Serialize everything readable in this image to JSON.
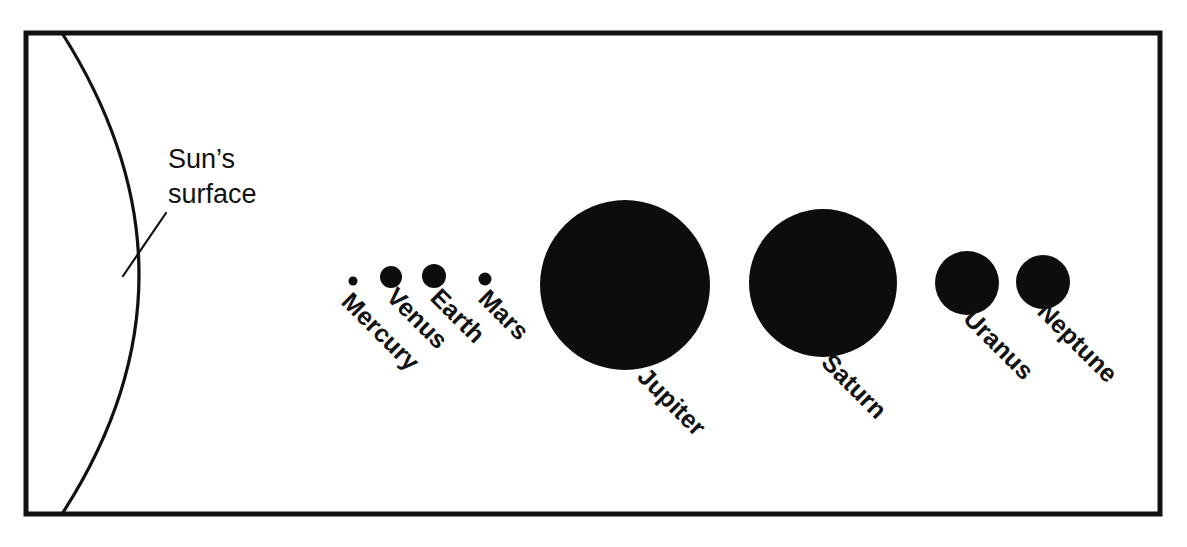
{
  "figure": {
    "background_color": "#ffffff",
    "ink_color": "#111111",
    "planet_fill_color": "#0d0d0d"
  },
  "frame": {
    "x": 26,
    "y": 33,
    "width": 1134,
    "height": 481
  },
  "sun": {
    "label_line_1": "Sun’s",
    "label_line_2": "surface",
    "label_x": 168,
    "label_line_1_y": 168,
    "label_line_2_y": 203,
    "leader_from_x": 166,
    "leader_from_y": 213,
    "leader_to_x": 123,
    "leader_to_y": 276,
    "arc_top_x": 62,
    "arc_top_y": 33,
    "arc_bottom_x": 62,
    "arc_bottom_y": 514,
    "arc_bulge_x": 139,
    "arc_bulge_y": 276
  },
  "chart_data": {
    "type": "scatter",
    "xlabel": "",
    "ylabel": "",
    "categories": [
      "Mercury",
      "Venus",
      "Earth",
      "Mars",
      "Jupiter",
      "Saturn",
      "Uranus",
      "Neptune"
    ],
    "values": [
      9,
      22,
      24,
      13,
      170,
      148,
      64,
      54
    ],
    "value_units": "pixel diameter (relative planet size)",
    "annotations": [
      "Sun’s surface"
    ],
    "grid": false,
    "legend": false
  },
  "planets": [
    {
      "name": "Mercury",
      "cx": 353,
      "cy": 281,
      "diameter": 9,
      "label_x": 340,
      "label_y": 303,
      "label_rotation": 45
    },
    {
      "name": "Venus",
      "cx": 391,
      "cy": 277,
      "diameter": 22,
      "label_x": 385,
      "label_y": 298,
      "label_rotation": 45
    },
    {
      "name": "Earth",
      "cx": 434,
      "cy": 276,
      "diameter": 24,
      "label_x": 429,
      "label_y": 299,
      "label_rotation": 45
    },
    {
      "name": "Mars",
      "cx": 485,
      "cy": 279,
      "diameter": 13,
      "label_x": 477,
      "label_y": 300,
      "label_rotation": 45
    },
    {
      "name": "Jupiter",
      "cx": 625,
      "cy": 285,
      "diameter": 170,
      "label_x": 636,
      "label_y": 378,
      "label_rotation": 45
    },
    {
      "name": "Saturn",
      "cx": 823,
      "cy": 283,
      "diameter": 148,
      "label_x": 820,
      "label_y": 364,
      "label_rotation": 45
    },
    {
      "name": "Uranus",
      "cx": 967,
      "cy": 283,
      "diameter": 64,
      "label_x": 962,
      "label_y": 320,
      "label_rotation": 45
    },
    {
      "name": "Neptune",
      "cx": 1043,
      "cy": 282,
      "diameter": 54,
      "label_x": 1036,
      "label_y": 313,
      "label_rotation": 45
    }
  ]
}
